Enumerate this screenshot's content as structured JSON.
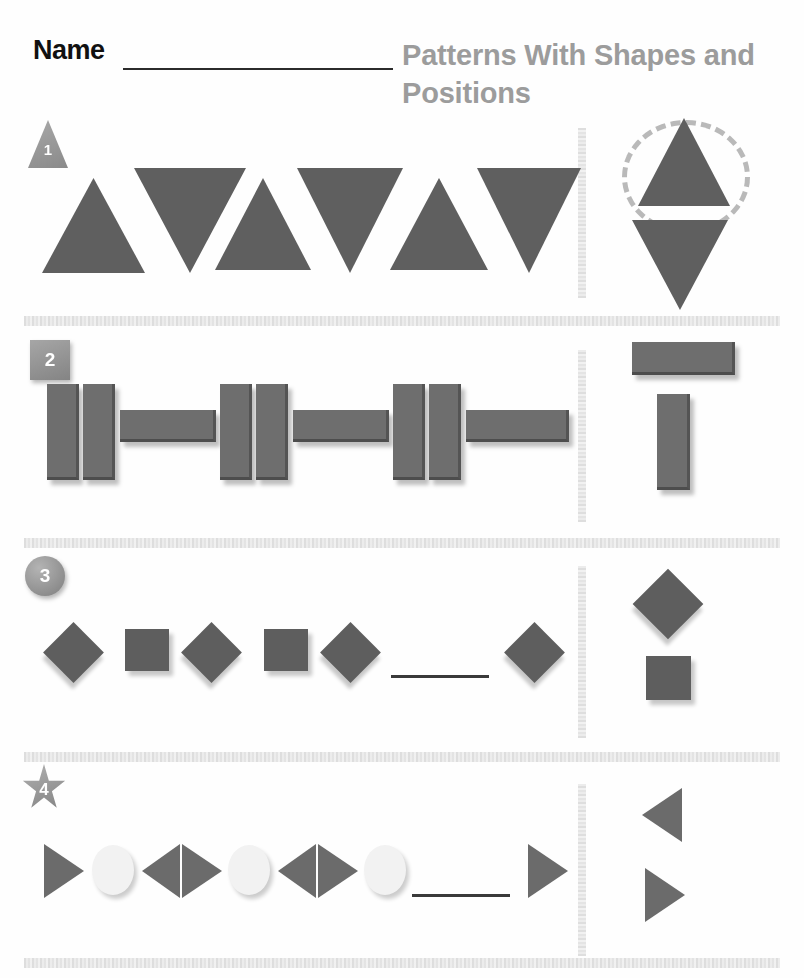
{
  "header": {
    "name_label": "Name",
    "name_line": "name-writing-line",
    "title": "Patterns With Shapes and Positions"
  },
  "exercises": [
    {
      "number": "1",
      "badge_shape": "triangle",
      "pattern_name": "alternating-up-down-triangles",
      "sequence": [
        "triangle-up",
        "triangle-down",
        "triangle-up",
        "triangle-down",
        "triangle-up",
        "triangle-down"
      ],
      "blank": false,
      "choices": [
        "triangle-up",
        "triangle-down"
      ],
      "circled_choice": "triangle-up"
    },
    {
      "number": "2",
      "badge_shape": "square",
      "pattern_name": "vertical-vertical-horizontal-bars",
      "sequence": [
        "bar-vertical",
        "bar-vertical",
        "bar-horizontal",
        "bar-vertical",
        "bar-vertical",
        "bar-horizontal",
        "bar-vertical",
        "bar-vertical",
        "bar-horizontal"
      ],
      "blank": false,
      "choices": [
        "bar-horizontal",
        "bar-vertical"
      ],
      "circled_choice": ""
    },
    {
      "number": "3",
      "badge_shape": "circle",
      "pattern_name": "alternating-diamond-square",
      "sequence": [
        "diamond",
        "square",
        "diamond",
        "square",
        "diamond",
        "blank",
        "diamond"
      ],
      "blank": true,
      "choices": [
        "diamond",
        "square"
      ],
      "circled_choice": ""
    },
    {
      "number": "4",
      "badge_shape": "star",
      "pattern_name": "triangle-right-circle-triangle-left",
      "sequence": [
        "triangle-right",
        "circle-white",
        "triangle-left",
        "triangle-right",
        "circle-white",
        "triangle-left",
        "triangle-right",
        "circle-white",
        "blank",
        "triangle-right"
      ],
      "blank": true,
      "choices": [
        "triangle-left",
        "triangle-right"
      ],
      "circled_choice": ""
    }
  ],
  "colors": {
    "shape_gray": "#5f5f5f",
    "title_gray": "#9c9c9c",
    "divider_gray": "#e4e4e4",
    "white_shape": "#f2f2f2",
    "circle_marker": "#b9b9b9"
  }
}
